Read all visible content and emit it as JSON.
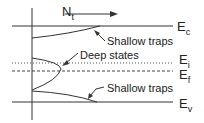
{
  "diagram": {
    "axis_label": {
      "main": "N",
      "sub": "t"
    },
    "levels": [
      {
        "main": "E",
        "sub": "c",
        "style": "solid"
      },
      {
        "main": "E",
        "sub": "i",
        "style": "dotted"
      },
      {
        "main": "E",
        "sub": "f",
        "style": "dashed"
      },
      {
        "main": "E",
        "sub": "v",
        "style": "solid"
      }
    ],
    "annotations": {
      "upper_traps": "Shallow traps",
      "deep": "Deep states",
      "lower_traps": "Shallow traps"
    },
    "line_color": "#333333"
  }
}
